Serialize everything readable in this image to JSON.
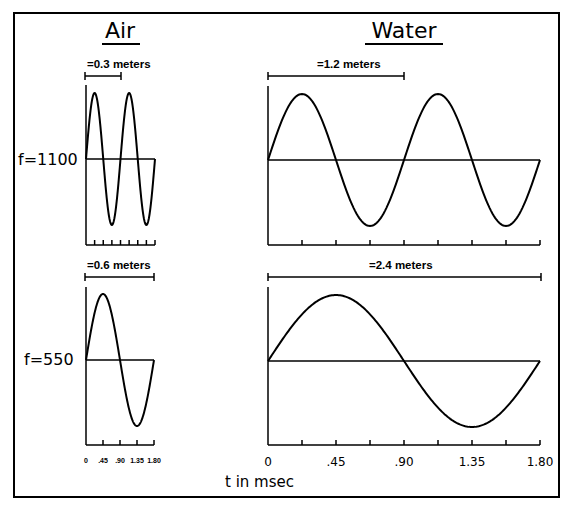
{
  "titles": {
    "air": "Air",
    "water": "Water"
  },
  "frequencies": {
    "top": "f=1100",
    "bottom": "f=550"
  },
  "wavelengths": {
    "air_top": "=0.3 meters",
    "water_top": "=1.2 meters",
    "air_bottom": "=0.6 meters",
    "water_bottom": "=2.4 meters"
  },
  "x_axis": {
    "label": "t in msec",
    "ticks": [
      "0",
      ".45",
      ".90",
      "1.35",
      "1.80"
    ]
  },
  "chart_data": [
    {
      "type": "line",
      "title": "Air, f=1100",
      "xlabel": "t in msec",
      "x_range": [
        0,
        1.8
      ],
      "cycles": 2,
      "wavelength": "0.3 meters"
    },
    {
      "type": "line",
      "title": "Water, f=1100",
      "xlabel": "t in msec",
      "x_range": [
        0,
        1.8
      ],
      "cycles": 2,
      "wavelength": "1.2 meters"
    },
    {
      "type": "line",
      "title": "Air, f=550",
      "xlabel": "t in msec",
      "x_range": [
        0,
        1.8
      ],
      "cycles": 1,
      "wavelength": "0.6 meters",
      "ticks": [
        "0",
        ".45",
        ".90",
        "1.35",
        "1.80"
      ]
    },
    {
      "type": "line",
      "title": "Water, f=550",
      "xlabel": "t in msec",
      "x_range": [
        0,
        1.8
      ],
      "cycles": 1,
      "wavelength": "2.4 meters",
      "ticks": [
        "0",
        ".45",
        ".90",
        "1.35",
        "1.80"
      ]
    }
  ]
}
